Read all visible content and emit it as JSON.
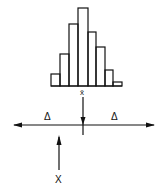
{
  "diagram": {
    "histogram": {
      "bars": [
        {
          "x": 51,
          "w": 9,
          "top": 74
        },
        {
          "x": 60,
          "w": 9,
          "top": 54
        },
        {
          "x": 69,
          "w": 9,
          "top": 24
        },
        {
          "x": 78,
          "w": 10,
          "top": 8
        },
        {
          "x": 88,
          "w": 8,
          "top": 32
        },
        {
          "x": 96,
          "w": 9,
          "top": 47
        },
        {
          "x": 105,
          "w": 8,
          "top": 70
        },
        {
          "x": 113,
          "w": 9,
          "top": 82
        }
      ],
      "baseline": 86,
      "mean_label": "x̄"
    },
    "axis": {
      "delta_left": "Δ",
      "delta_right": "Δ"
    },
    "observation_label": "X",
    "stroke_color": "#111111"
  }
}
